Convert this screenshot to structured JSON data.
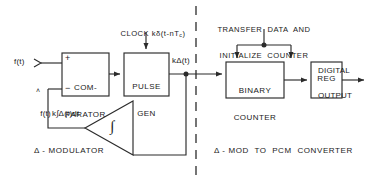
{
  "diagram": {
    "colors": {
      "line": "#2b2b2b",
      "text": "#1a1a1a",
      "background": "#ffffff"
    },
    "blocks": [
      {
        "id": "comparator",
        "line1": "COM-",
        "line2": "PARATOR"
      },
      {
        "id": "pulse_gen",
        "line1": "PULSE",
        "line2": "GEN"
      },
      {
        "id": "integrator",
        "symbol": "∫"
      },
      {
        "id": "binary_counter",
        "line1": "BINARY",
        "line2": "COUNTER"
      },
      {
        "id": "register",
        "line1": "REG",
        "line2": ""
      }
    ],
    "signals": {
      "input": "f(t)",
      "feedback_input_base": "f(t)",
      "feedback_input_hat": "˄",
      "integrator_output": "k∫Δ(t)dt",
      "pulse_output_base": "kΔ(t)",
      "digital_output_line1": "DIGITAL",
      "digital_output_line2": "OUTPUT"
    },
    "clock": {
      "prefix": "CLOCK kδ(t-nT",
      "subscript": "c",
      "suffix": ")"
    },
    "control": {
      "line1": "TRANSFER  DATA  AND",
      "line2": "INITIALIZE  COUNTER"
    },
    "comparator_signs": {
      "plus": "+",
      "minus": "−"
    },
    "sections": {
      "left": "Δ - MODULATOR",
      "right": "Δ - MOD  TO  PCM  CONVERTER"
    }
  }
}
